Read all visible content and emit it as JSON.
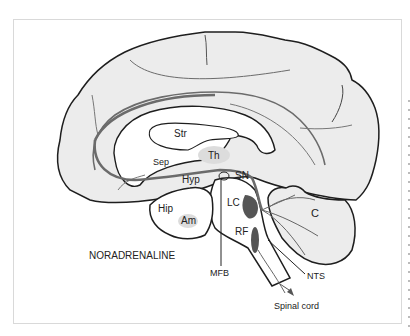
{
  "figure": {
    "title": "NORADRENALINE",
    "colors": {
      "brain_fill": "#ececec",
      "outline": "#1e1e1e",
      "pathway": "#6b6b6b",
      "nucleus": "#555555",
      "background": "#ffffff"
    },
    "labels": {
      "str": "Str",
      "th": "Th",
      "sep": "Sep",
      "hyp": "Hyp",
      "sn": "SN",
      "lc": "LC",
      "hip": "Hip",
      "am": "Am",
      "rf": "RF",
      "c": "C",
      "mfb": "MFB",
      "nts": "NTS",
      "spinal_cord": "Spinal cord"
    }
  }
}
